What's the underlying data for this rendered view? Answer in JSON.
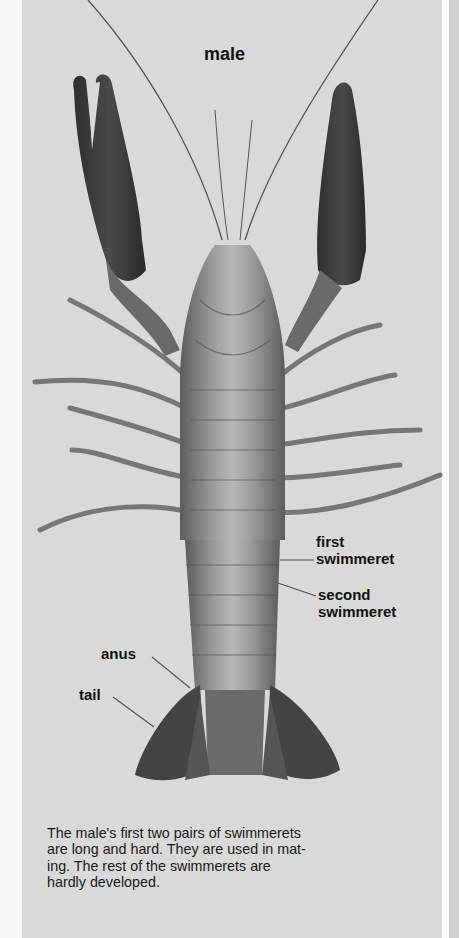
{
  "page": {
    "title": "male",
    "labels": {
      "first_swimmeret": [
        "first",
        "swimmeret"
      ],
      "second_swimmeret": [
        "second",
        "swimmeret"
      ],
      "anus": "anus",
      "tail": "tail"
    },
    "caption_lines": [
      "The male's first two pairs of swimmerets",
      "are long and hard. They are used in mat-",
      "ing. The rest of the swimmerets are",
      "hardly developed."
    ],
    "illustration": "crayfish-ventral-view-male",
    "colors": {
      "panel": "#d9d9d9",
      "claw": "#3a3a3a",
      "body": "#8a8a8a",
      "text": "#111111"
    }
  }
}
